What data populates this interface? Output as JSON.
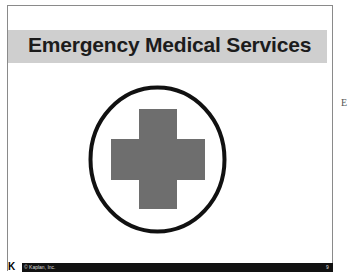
{
  "slide": {
    "title": "Emergency Medical Services",
    "emblem": "medical-cross-in-circle",
    "footer": {
      "logo": "K",
      "copyright": "© Kaplan, Inc.",
      "page_number": "9"
    }
  },
  "adjacent_slide": {
    "edge_char": "E"
  },
  "colors": {
    "title_band": "#cfcfcf",
    "cross": "#6e6e6e",
    "circle": "#111111",
    "footer": "#111111"
  }
}
